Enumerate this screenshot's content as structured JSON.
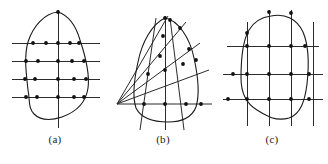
{
  "figure": {
    "background_color": "#ffffff",
    "ink_color": "#1a1a1a",
    "dot_color": "#111111",
    "width": 328,
    "height": 164,
    "panels": [
      {
        "id": "a",
        "caption": "(a)",
        "description": "closed region sampled by four horizontal scan lines and one vertical centre axis",
        "sampling_type": "horizontal-scanlines",
        "curve": "M 58,12 C 70,16 76,26 80,40 C 86,58 90,74 88,88 C 86,102 76,112 62,117 C 50,121 40,120 34,114 C 28,108 30,100 28,90 C 26,72 24,56 28,42 C 33,26 45,13 58,12 Z",
        "axis_vertical": {
          "x": 58,
          "y1": 10,
          "y2": 128
        },
        "scan_lines": [
          {
            "y": 43,
            "x1": 12,
            "x2": 100
          },
          {
            "y": 61,
            "x1": 12,
            "x2": 100
          },
          {
            "y": 79,
            "x1": 12,
            "x2": 100
          },
          {
            "y": 97,
            "x1": 12,
            "x2": 100
          }
        ],
        "dots": [
          [
            58,
            12
          ],
          [
            33,
            43
          ],
          [
            46,
            43
          ],
          [
            58,
            43
          ],
          [
            70,
            43
          ],
          [
            79,
            43
          ],
          [
            26,
            61
          ],
          [
            38,
            61
          ],
          [
            58,
            61
          ],
          [
            72,
            61
          ],
          [
            84,
            61
          ],
          [
            25,
            79
          ],
          [
            35,
            79
          ],
          [
            58,
            79
          ],
          [
            74,
            79
          ],
          [
            86,
            79
          ],
          [
            26,
            97
          ],
          [
            37,
            97
          ],
          [
            58,
            97
          ],
          [
            74,
            97
          ],
          [
            84,
            97
          ]
        ]
      },
      {
        "id": "b",
        "caption": "(b)",
        "description": "closed region sampled by a radial fan of rays emanating from a vertex at the lower left",
        "sampling_type": "radial-fan",
        "curve": "M 57,18 C 44,24 34,42 30,62 C 26,80 24,96 28,108 C 33,118 46,122 60,122 C 74,122 84,117 88,107 C 92,94 90,76 86,58 C 82,38 70,20 57,18 Z",
        "axis_vertical": {
          "x": 57,
          "y1": 16,
          "y2": 130
        },
        "axis_horizontal": {
          "y": 104,
          "x1": 8,
          "x2": 104
        },
        "fan_origin": [
          9,
          104
        ],
        "fan_rays": [
          {
            "x1": 9,
            "y1": 104,
            "x2": 104,
            "y2": 104
          },
          {
            "x1": 9,
            "y1": 104,
            "x2": 101,
            "y2": 70
          },
          {
            "x1": 9,
            "y1": 104,
            "x2": 92,
            "y2": 43
          },
          {
            "x1": 9,
            "y1": 104,
            "x2": 78,
            "y2": 22
          },
          {
            "x1": 9,
            "y1": 104,
            "x2": 60,
            "y2": 16
          }
        ],
        "slant_lines": [
          {
            "x1": 48,
            "y1": 18,
            "x2": 32,
            "y2": 130
          },
          {
            "x1": 62,
            "y1": 18,
            "x2": 76,
            "y2": 130
          }
        ],
        "dots": [
          [
            57,
            18
          ],
          [
            62,
            20
          ],
          [
            72,
            28
          ],
          [
            55,
            36
          ],
          [
            81,
            49
          ],
          [
            52,
            56
          ],
          [
            40,
            74
          ],
          [
            57,
            70
          ],
          [
            75,
            64
          ],
          [
            88,
            60
          ],
          [
            36,
            104
          ],
          [
            57,
            104
          ],
          [
            78,
            104
          ],
          [
            93,
            104
          ]
        ]
      },
      {
        "id": "c",
        "caption": "(c)",
        "description": "closed region sampled by a full rectangular grid of four vertical and three horizontal lines",
        "sampling_type": "rectangular-grid",
        "curve": "M 54,16 C 68,13 80,19 86,32 C 92,46 92,66 90,84 C 88,100 84,114 72,118 C 58,122 48,115 40,110 C 30,104 24,94 24,78 C 24,58 26,40 32,30 C 38,20 46,17 54,16 Z",
        "vertical_lines": [
          {
            "x": 30,
            "y1": 22,
            "y2": 126
          },
          {
            "x": 52,
            "y1": 10,
            "y2": 126
          },
          {
            "x": 74,
            "y1": 10,
            "y2": 126
          },
          {
            "x": 96,
            "y1": 22,
            "y2": 126
          }
        ],
        "horizontal_lines": [
          {
            "y": 46,
            "x1": 10,
            "x2": 102
          },
          {
            "y": 74,
            "x1": 6,
            "x2": 106
          },
          {
            "y": 99,
            "x1": 6,
            "x2": 106
          }
        ],
        "dots": [
          [
            52,
            12
          ],
          [
            74,
            13
          ],
          [
            30,
            33
          ],
          [
            30,
            46
          ],
          [
            52,
            46
          ],
          [
            74,
            46
          ],
          [
            88,
            46
          ],
          [
            16,
            74
          ],
          [
            30,
            74
          ],
          [
            52,
            74
          ],
          [
            74,
            74
          ],
          [
            92,
            74
          ],
          [
            11,
            99
          ],
          [
            30,
            99
          ],
          [
            52,
            99
          ],
          [
            74,
            99
          ],
          [
            92,
            99
          ]
        ]
      }
    ]
  }
}
